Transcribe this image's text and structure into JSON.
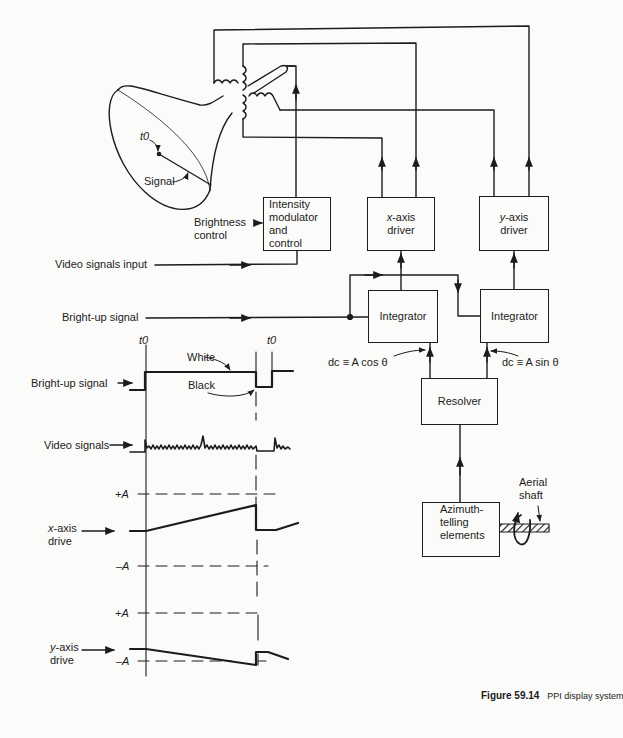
{
  "figure": {
    "number": "Figure 59.14",
    "title": "PPI display system"
  },
  "crt": {
    "t0_label": "t0",
    "signal_label": "Signal"
  },
  "blocks": {
    "intensity": {
      "lines": [
        "Intensity",
        "modulator",
        "and",
        "control"
      ]
    },
    "x_driver": {
      "var": "x",
      "line1_rest": "-axis",
      "line2": "driver"
    },
    "y_driver": {
      "var": "y",
      "line1_rest": "-axis",
      "line2": "driver"
    },
    "integrator_x": {
      "label": "Integrator"
    },
    "integrator_y": {
      "label": "Integrator"
    },
    "resolver": {
      "label": "Resolver"
    },
    "azimuth": {
      "lines": [
        "Azimuth-",
        "telling",
        "elements"
      ]
    }
  },
  "inputs": {
    "brightness": [
      "Brightness",
      "control"
    ],
    "video_input": "Video signals input",
    "bright_up": "Bright-up signal",
    "aerial_shaft": [
      "Aerial",
      "shaft"
    ]
  },
  "resolver_outputs": {
    "cos": "dc  ≡  A cos θ",
    "sin": "dc  ≡  A sin θ"
  },
  "timing": {
    "t0_left": "t0",
    "t0_right": "t0",
    "white": "White",
    "black": "Black",
    "rows": [
      {
        "label": "Bright-up signal"
      },
      {
        "label": "Video signals"
      },
      {
        "label_line1_var": "x",
        "label_line1_rest": "-axis",
        "label_line2": "drive"
      },
      {
        "label_line1_var": "y",
        "label_line1_rest": "-axis",
        "label_line2": "drive"
      }
    ],
    "levels": {
      "plus": "+A",
      "minus": "–A"
    }
  },
  "colors": {
    "ink": "#1c1c1c",
    "paper": "#fbfbf9"
  }
}
